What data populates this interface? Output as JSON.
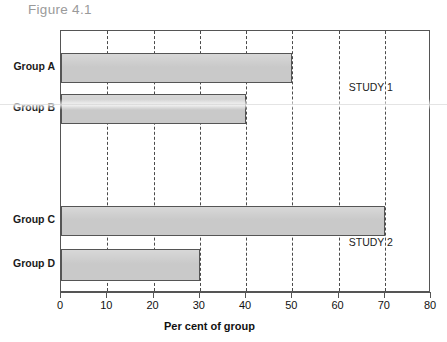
{
  "figure": {
    "title": "Figure 4.1"
  },
  "chart_data": {
    "type": "bar",
    "orientation": "horizontal",
    "title": "Figure 4.1",
    "xlabel": "Per cent of group",
    "ylabel": "",
    "xlim": [
      0,
      80
    ],
    "xticks": [
      0,
      10,
      20,
      30,
      40,
      50,
      60,
      70,
      80
    ],
    "xtick_labels": [
      "0",
      "10",
      "20",
      "30",
      "40",
      "50",
      "60",
      "70",
      "80"
    ],
    "grid": "vertical-dashed",
    "legend": "none",
    "categories": [
      "Group A",
      "Group B",
      "Group C",
      "Group D"
    ],
    "values": [
      50,
      40,
      70,
      30
    ],
    "bars": [
      {
        "label": "Group A",
        "value": 50,
        "study": "STUDY 1"
      },
      {
        "label": "Group B",
        "value": 40,
        "study": "STUDY 1"
      },
      {
        "label": "Group C",
        "value": 70,
        "study": "STUDY 2"
      },
      {
        "label": "Group D",
        "value": 30,
        "study": "STUDY 2"
      }
    ],
    "annotations": [
      {
        "text": "STUDY 1",
        "x": 62,
        "category": "Group A"
      },
      {
        "text": "STUDY 2",
        "x": 62,
        "category": "Group D"
      }
    ],
    "colors": {
      "bar_fill": "#c9c9c9",
      "bar_edge": "#555555",
      "grid": "#4a4a4a",
      "axis": "#555555",
      "text": "#111111",
      "title": "#9a9a9a"
    }
  }
}
